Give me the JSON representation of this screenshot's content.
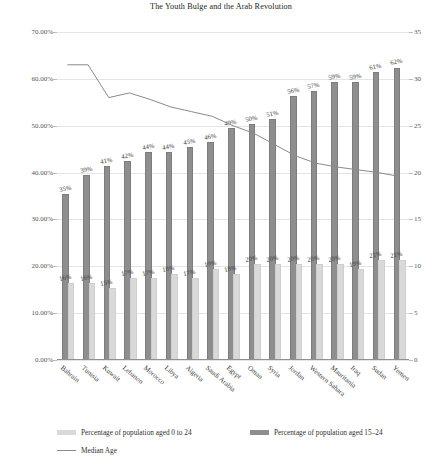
{
  "chart_data": {
    "type": "bar",
    "title": "The Youth Bulge and the Arab Revolution",
    "xlabel": "",
    "ylabel": "",
    "ylim": [
      0,
      70
    ],
    "y2lim": [
      0,
      35
    ],
    "grid": true,
    "legend_position": "bottom-left",
    "categories": [
      "Bahrain",
      "Tunisia",
      "Kuwait",
      "Lebanon",
      "Morocco",
      "Libya",
      "Algeria",
      "Saudi Arabia",
      "Egypt",
      "Oman",
      "Syria",
      "Jordan",
      "Western Sahara",
      "Mauritania",
      "Iraq",
      "Sudan",
      "Yemen"
    ],
    "y_tick_labels": [
      "0.00%",
      "10.00%",
      "20.00%",
      "30.00%",
      "40.00%",
      "50.00%",
      "60.00%",
      "70.00%"
    ],
    "y_tick_values": [
      0,
      10,
      20,
      30,
      40,
      50,
      60,
      70
    ],
    "y2_tick_labels": [
      "0",
      "5",
      "10",
      "15",
      "20",
      "25",
      "30",
      "35"
    ],
    "y2_tick_values": [
      0,
      5,
      10,
      15,
      20,
      25,
      30,
      35
    ],
    "series": [
      {
        "name": "Percentage of population aged 0 to 24",
        "type": "bar",
        "color": "#d9d9d9",
        "axis": "left",
        "values": [
          16,
          16,
          15,
          17,
          17,
          18,
          17,
          19,
          18,
          20,
          20,
          20,
          20,
          20,
          19,
          21,
          21
        ],
        "labels": [
          "16%",
          "16%",
          "15%",
          "17%",
          "17%",
          "18%",
          "17%",
          "19%",
          "18%",
          "20%",
          "20%",
          "20%",
          "20%",
          "20%",
          "19%",
          "21%",
          "21%"
        ]
      },
      {
        "name": "Percentage of population aged 15–24",
        "type": "bar",
        "color": "#8e8e8e",
        "axis": "left",
        "values": [
          35,
          39,
          41,
          42,
          44,
          44,
          45,
          46,
          49,
          50,
          51,
          56,
          57,
          59,
          59,
          61,
          62
        ],
        "labels": [
          "35%",
          "39%",
          "41%",
          "42%",
          "44%",
          "44%",
          "45%",
          "46%",
          "49%",
          "50%",
          "51%",
          "56%",
          "57%",
          "59%",
          "59%",
          "61%",
          "62%"
        ]
      },
      {
        "name": "Median Age",
        "type": "line",
        "color": "#8a8a8a",
        "axis": "right",
        "values": [
          31.5,
          31.5,
          28.0,
          28.5,
          27.8,
          27.0,
          26.5,
          26.0,
          25.0,
          24.2,
          23.0,
          21.8,
          21.0,
          20.6,
          20.3,
          20.0,
          19.6
        ]
      }
    ]
  },
  "legend": {
    "items": [
      {
        "label": "Percentage of population aged 0 to 24",
        "swatch": "light"
      },
      {
        "label": "Percentage of population aged 15–24",
        "swatch": "dark"
      },
      {
        "label": "Median Age",
        "swatch": "line"
      }
    ]
  }
}
